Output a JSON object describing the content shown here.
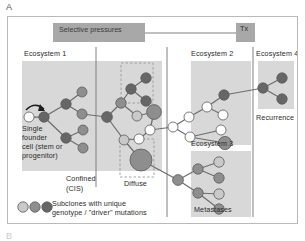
{
  "figure": {
    "panel_label_a": "A",
    "panel_label_b": "B",
    "banner_label": "Selective pressures",
    "treatment_label": "Tx",
    "labels": {
      "ecosystem1": "Ecosystem 1",
      "ecosystem2": "Ecosystem 2",
      "ecosystem3": "Ecosystem 3",
      "ecosystem4": "Ecosystem 4",
      "confined_line1": "Confined",
      "confined_line2": "(CIS)",
      "diffuse": "Diffuse",
      "metastases": "Metastases",
      "recurrence": "Recurrence",
      "founder_line1": "Single",
      "founder_line2": "founder",
      "founder_line3": "cell (stem or",
      "founder_line4": "progenitor)"
    },
    "legend": {
      "line1": "Subclones with unique",
      "line2": "genotype / \"driver\" mutations",
      "swatches": [
        "light-gray-circle",
        "medium-gray-circle",
        "dark-gray-circle"
      ]
    },
    "colors": {
      "node_white": "#ffffff",
      "node_light": "#c9c9c9",
      "node_medium": "#8e8e8e",
      "node_dark": "#666666",
      "ecosystem_bg": "#d8d8d8",
      "banner_bg": "#a8a8a8",
      "tx_bg": "#a8a8a8",
      "edge": "#6d6d6d",
      "dashed_box": "#9a9a9a",
      "frame": "#b9b9b9",
      "divider": "#808080"
    }
  },
  "chart_data": {
    "type": "diagram",
    "ecosystem_regions": [
      {
        "name": "Ecosystem 1",
        "x": 14,
        "y": 44,
        "w": 140,
        "h": 110
      },
      {
        "name": "Ecosystem 2",
        "x": 183,
        "y": 44,
        "w": 60,
        "h": 84
      },
      {
        "name": "Ecosystem 3",
        "x": 183,
        "y": 134,
        "w": 60,
        "h": 66
      },
      {
        "name": "Ecosystem 4",
        "x": 250,
        "y": 44,
        "w": 36,
        "h": 48
      }
    ],
    "dashed_boxes": [
      {
        "name": "diffuse-upper",
        "x": 113,
        "y": 46,
        "w": 32,
        "h": 40
      },
      {
        "name": "diffuse-lower",
        "x": 112,
        "y": 122,
        "w": 34,
        "h": 38
      }
    ],
    "nodes": [
      {
        "id": "founder",
        "x": 21,
        "y": 100,
        "r": 5.0,
        "shade": "white"
      },
      {
        "id": "n1",
        "x": 36,
        "y": 100,
        "r": 5.2,
        "shade": "dark"
      },
      {
        "id": "n2",
        "x": 58,
        "y": 87,
        "r": 5.2,
        "shade": "dark"
      },
      {
        "id": "n3",
        "x": 74,
        "y": 75,
        "r": 5.0,
        "shade": "medium"
      },
      {
        "id": "n4",
        "x": 74,
        "y": 97,
        "r": 5.0,
        "shade": "medium"
      },
      {
        "id": "n5",
        "x": 58,
        "y": 121,
        "r": 5.2,
        "shade": "dark"
      },
      {
        "id": "n6",
        "x": 75,
        "y": 113,
        "r": 5.0,
        "shade": "medium"
      },
      {
        "id": "n7",
        "x": 75,
        "y": 131,
        "r": 5.0,
        "shade": "medium"
      },
      {
        "id": "n8",
        "x": 99,
        "y": 100,
        "r": 5.4,
        "shade": "dark"
      },
      {
        "id": "n9",
        "x": 113,
        "y": 86,
        "r": 5.2,
        "shade": "medium"
      },
      {
        "id": "n10",
        "x": 123,
        "y": 72,
        "r": 5.2,
        "shade": "dark"
      },
      {
        "id": "n11",
        "x": 138,
        "y": 61,
        "r": 5.2,
        "shade": "dark"
      },
      {
        "id": "n12",
        "x": 138,
        "y": 84,
        "r": 5.2,
        "shade": "dark"
      },
      {
        "id": "n13",
        "x": 129,
        "y": 99,
        "r": 5.0,
        "shade": "light"
      },
      {
        "id": "n14",
        "x": 146,
        "y": 95,
        "r": 7.4,
        "shade": "medium"
      },
      {
        "id": "n15",
        "x": 142,
        "y": 113,
        "r": 5.0,
        "shade": "white"
      },
      {
        "id": "n16",
        "x": 131,
        "y": 122,
        "r": 5.0,
        "shade": "white"
      },
      {
        "id": "n17",
        "x": 116,
        "y": 123,
        "r": 5.0,
        "shade": "light"
      },
      {
        "id": "n18",
        "x": 133,
        "y": 143,
        "r": 11.0,
        "shade": "medium"
      },
      {
        "id": "e2a",
        "x": 165,
        "y": 110,
        "r": 5.0,
        "shade": "white"
      },
      {
        "id": "e2b",
        "x": 181,
        "y": 100,
        "r": 5.0,
        "shade": "white"
      },
      {
        "id": "e2c",
        "x": 199,
        "y": 90,
        "r": 5.0,
        "shade": "white"
      },
      {
        "id": "e2d",
        "x": 216,
        "y": 78,
        "r": 5.2,
        "shade": "dark"
      },
      {
        "id": "e2e",
        "x": 215,
        "y": 98,
        "r": 5.0,
        "shade": "white"
      },
      {
        "id": "e2f",
        "x": 182,
        "y": 120,
        "r": 5.0,
        "shade": "white"
      },
      {
        "id": "e2g",
        "x": 213,
        "y": 113,
        "r": 5.0,
        "shade": "white"
      },
      {
        "id": "e2h",
        "x": 217,
        "y": 126,
        "r": 6.6,
        "shade": "medium"
      },
      {
        "id": "e3a",
        "x": 170,
        "y": 163,
        "r": 5.4,
        "shade": "medium"
      },
      {
        "id": "e3b",
        "x": 190,
        "y": 152,
        "r": 5.2,
        "shade": "medium"
      },
      {
        "id": "e3c",
        "x": 211,
        "y": 145,
        "r": 5.2,
        "shade": "light"
      },
      {
        "id": "e3d",
        "x": 211,
        "y": 161,
        "r": 5.2,
        "shade": "medium"
      },
      {
        "id": "e3e",
        "x": 190,
        "y": 176,
        "r": 5.2,
        "shade": "medium"
      },
      {
        "id": "e3f",
        "x": 211,
        "y": 177,
        "r": 5.2,
        "shade": "light"
      },
      {
        "id": "e3g",
        "x": 211,
        "y": 192,
        "r": 5.2,
        "shade": "medium"
      },
      {
        "id": "e4a",
        "x": 255,
        "y": 71,
        "r": 5.2,
        "shade": "dark"
      },
      {
        "id": "e4b",
        "x": 274,
        "y": 61,
        "r": 5.2,
        "shade": "dark"
      },
      {
        "id": "e4c",
        "x": 274,
        "y": 82,
        "r": 5.2,
        "shade": "dark"
      }
    ],
    "edges": [
      [
        "founder",
        "n1"
      ],
      [
        "n1",
        "n2"
      ],
      [
        "n2",
        "n3"
      ],
      [
        "n2",
        "n4"
      ],
      [
        "n1",
        "n5"
      ],
      [
        "n5",
        "n6"
      ],
      [
        "n5",
        "n7"
      ],
      [
        "n4",
        "n8"
      ],
      [
        "n8",
        "n9"
      ],
      [
        "n9",
        "n10"
      ],
      [
        "n10",
        "n11"
      ],
      [
        "n10",
        "n12"
      ],
      [
        "n9",
        "n13"
      ],
      [
        "n13",
        "n14"
      ],
      [
        "n14",
        "n15"
      ],
      [
        "n15",
        "n16"
      ],
      [
        "n8",
        "n17"
      ],
      [
        "n17",
        "n16"
      ],
      [
        "n17",
        "n18"
      ],
      [
        "n15",
        "e2a"
      ],
      [
        "e2a",
        "e2b"
      ],
      [
        "e2b",
        "e2c"
      ],
      [
        "e2c",
        "e2d"
      ],
      [
        "e2c",
        "e2e"
      ],
      [
        "e2a",
        "e2f"
      ],
      [
        "e2f",
        "e2g"
      ],
      [
        "e2f",
        "e2h"
      ],
      [
        "n18",
        "e3a"
      ],
      [
        "e3a",
        "e3b"
      ],
      [
        "e3b",
        "e3c"
      ],
      [
        "e3b",
        "e3d"
      ],
      [
        "e3a",
        "e3e"
      ],
      [
        "e3e",
        "e3f"
      ],
      [
        "e3e",
        "e3g"
      ],
      [
        "e2d",
        "e4a"
      ],
      [
        "e4a",
        "e4b"
      ],
      [
        "e4a",
        "e4c"
      ]
    ],
    "dividers": [
      {
        "name": "divider-1",
        "x": 88,
        "y1": 30,
        "y2": 170
      },
      {
        "name": "divider-2",
        "x": 159,
        "y1": 30,
        "y2": 200
      },
      {
        "name": "divider-3",
        "x": 245,
        "y1": 30,
        "y2": 200
      }
    ]
  }
}
